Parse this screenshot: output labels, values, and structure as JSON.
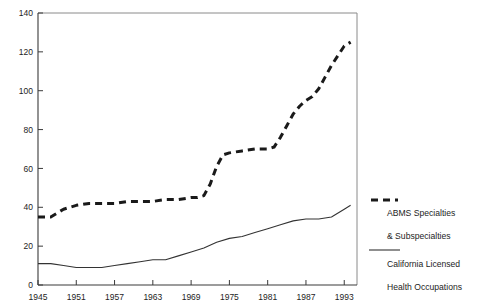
{
  "chart_data": {
    "type": "line",
    "title": "",
    "xlabel": "",
    "ylabel": "",
    "xlim": [
      1945,
      1995
    ],
    "ylim": [
      0,
      140
    ],
    "grid": false,
    "legend_position": "right",
    "y_ticks": [
      0,
      20,
      40,
      60,
      80,
      100,
      120,
      140
    ],
    "x_ticks": [
      1945,
      1951,
      1957,
      1963,
      1969,
      1975,
      1981,
      1987,
      1993
    ],
    "series": [
      {
        "name": "ABMS Specialties & Subspecialties",
        "style": "dashed",
        "color": "#1a1a1a",
        "x": [
          1945,
          1947,
          1949,
          1951,
          1953,
          1955,
          1957,
          1959,
          1961,
          1963,
          1965,
          1967,
          1969,
          1970,
          1971,
          1972,
          1973,
          1974,
          1975,
          1977,
          1979,
          1981,
          1982,
          1983,
          1984,
          1985,
          1986,
          1987,
          1988,
          1989,
          1990,
          1991,
          1992,
          1993,
          1994
        ],
        "values": [
          35,
          35,
          39,
          41,
          42,
          42,
          42,
          43,
          43,
          43,
          44,
          44,
          45,
          45,
          46,
          52,
          61,
          67,
          68,
          69,
          70,
          70,
          71,
          76,
          82,
          88,
          92,
          95,
          97,
          101,
          107,
          113,
          118,
          123,
          125
        ]
      },
      {
        "name": "California Licensed Health Occupations",
        "style": "solid",
        "color": "#333333",
        "x": [
          1945,
          1947,
          1949,
          1951,
          1953,
          1955,
          1957,
          1959,
          1961,
          1963,
          1965,
          1967,
          1969,
          1971,
          1973,
          1975,
          1977,
          1979,
          1981,
          1983,
          1985,
          1987,
          1989,
          1991,
          1993,
          1994
        ],
        "values": [
          11,
          11,
          10,
          9,
          9,
          9,
          10,
          11,
          12,
          13,
          13,
          15,
          17,
          19,
          22,
          24,
          25,
          27,
          29,
          31,
          33,
          34,
          34,
          35,
          39,
          41
        ]
      }
    ]
  },
  "legend": {
    "entries": [
      {
        "swatch": "dashed-line-swatch",
        "line1": "ABMS Specialties",
        "line2": "& Subspecialties"
      },
      {
        "swatch": "solid-line-swatch",
        "line1": "California Licensed",
        "line2": "Health Occupations"
      }
    ]
  },
  "axis_labels": {
    "y": [
      "140",
      "120",
      "100",
      "80",
      "60",
      "40",
      "20",
      "0"
    ],
    "x": [
      "1945",
      "1951",
      "1957",
      "1963",
      "1969",
      "1975",
      "1981",
      "1987",
      "1993"
    ]
  }
}
